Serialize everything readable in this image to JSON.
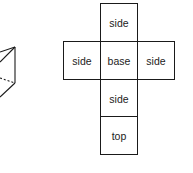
{
  "diagram": {
    "type": "cube-net",
    "cells": [
      {
        "id": "side-top",
        "label": "side"
      },
      {
        "id": "side-left",
        "label": "side"
      },
      {
        "id": "base",
        "label": "base"
      },
      {
        "id": "side-right",
        "label": "side"
      },
      {
        "id": "side-bottom",
        "label": "side"
      },
      {
        "id": "top",
        "label": "top"
      }
    ],
    "line_color": "#1a1a1a"
  }
}
